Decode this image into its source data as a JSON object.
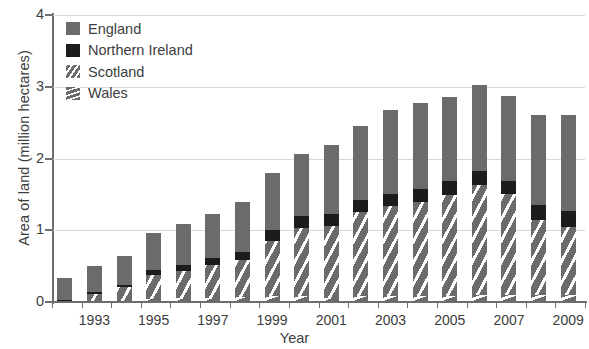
{
  "chart_data": {
    "type": "bar",
    "stacked": true,
    "title": "",
    "xlabel": "Year",
    "ylabel": "Area of land (million hectares)",
    "ylim": [
      0,
      4
    ],
    "yticks": [
      0,
      1,
      2,
      3,
      4
    ],
    "grid": true,
    "legend_position": "top-left",
    "categories": [
      "1992",
      "1993",
      "1994",
      "1995",
      "1996",
      "1997",
      "1998",
      "1999",
      "2000",
      "2001",
      "2002",
      "2003",
      "2004",
      "2005",
      "2006",
      "2007",
      "2008",
      "2009"
    ],
    "tick_labels": [
      "",
      "1993",
      "",
      "1995",
      "",
      "1997",
      "",
      "1999",
      "",
      "2001",
      "",
      "2003",
      "",
      "2005",
      "",
      "2007",
      "",
      "2009"
    ],
    "totals": [
      0.33,
      0.5,
      0.64,
      0.96,
      1.09,
      1.23,
      1.4,
      1.8,
      2.06,
      2.19,
      2.46,
      2.68,
      2.77,
      2.86,
      3.02,
      2.87,
      2.61,
      2.6
    ],
    "series": [
      {
        "name": "England",
        "color": "#6b6b6b",
        "pattern": "solid",
        "values": [
          0.3,
          0.36,
          0.4,
          0.52,
          0.58,
          0.62,
          0.7,
          0.79,
          0.86,
          0.96,
          1.04,
          1.17,
          1.19,
          1.18,
          1.19,
          1.18,
          1.26,
          1.33
        ]
      },
      {
        "name": "Northern Ireland",
        "color": "#1c1c1c",
        "pattern": "solid-dark",
        "values": [
          0.02,
          0.03,
          0.03,
          0.07,
          0.08,
          0.09,
          0.11,
          0.16,
          0.17,
          0.17,
          0.17,
          0.17,
          0.18,
          0.19,
          0.2,
          0.18,
          0.21,
          0.22
        ]
      },
      {
        "name": "Scotland",
        "color": "#6b6b6b",
        "pattern": "diagonal-stripe",
        "values": [
          0.0,
          0.1,
          0.19,
          0.33,
          0.38,
          0.46,
          0.52,
          0.77,
          0.95,
          1.0,
          1.17,
          1.26,
          1.31,
          1.4,
          1.53,
          1.41,
          1.04,
          0.95
        ]
      },
      {
        "name": "Wales",
        "color": "#6b6b6b",
        "pattern": "horizontal-stripe",
        "values": [
          0.01,
          0.01,
          0.02,
          0.04,
          0.05,
          0.06,
          0.07,
          0.08,
          0.08,
          0.06,
          0.08,
          0.08,
          0.09,
          0.09,
          0.1,
          0.1,
          0.1,
          0.1
        ]
      }
    ]
  },
  "legend": {
    "items": [
      {
        "label": "England",
        "swatch_class": "sw-england"
      },
      {
        "label": "Northern Ireland",
        "swatch_class": "sw-ni"
      },
      {
        "label": "Scotland",
        "swatch_class": "sw-scotland"
      },
      {
        "label": "Wales",
        "swatch_class": "sw-wales"
      }
    ]
  },
  "axis": {
    "y_title": "Area of land (million hectares)",
    "x_title": "Year"
  }
}
